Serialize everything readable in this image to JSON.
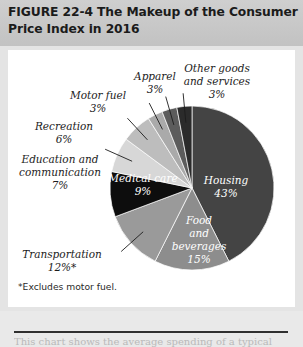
{
  "figure": {
    "number": "FIGURE  22-4",
    "title": "The Makeup of the Consumer Price Index in 2016",
    "title_line1": "FIGURE  22-4   The Makeup of the Consumer",
    "title_line2": "Price Index in 2016",
    "footnote": "*Excludes motor fuel."
  },
  "chart_data": {
    "type": "pie",
    "title": "The Makeup of the Consumer Price Index in 2016",
    "unit": "percent",
    "legend": "none",
    "labels_on_slices": true,
    "categories": [
      "Housing",
      "Food and beverages",
      "Transportation",
      "Medical care",
      "Education and communication",
      "Recreation",
      "Motor fuel",
      "Apparel",
      "Other goods and services"
    ],
    "values": [
      43,
      15,
      12,
      9,
      7,
      6,
      3,
      3,
      3
    ],
    "slices": [
      {
        "name": "Housing",
        "label": "Housing",
        "label_line2": "",
        "value": 43,
        "value_text": "43%",
        "color": "#444444",
        "text_color": "#ffffff",
        "placement": "inside",
        "lx": 226,
        "ly": 184,
        "l2y": 197
      },
      {
        "name": "Food and beverages",
        "label": "Food",
        "label_line2": "and",
        "label_line3": "beverages",
        "value": 15,
        "value_text": "15%",
        "color": "#8d8d8d",
        "text_color": "#ffffff",
        "placement": "inside",
        "lx": 199,
        "ly": 224,
        "l2y": 238
      },
      {
        "name": "Transportation",
        "label": "Transportation",
        "label_line2": "",
        "value": 12,
        "value_text": "12%*",
        "color": "#9a9a9a",
        "text_color": "#1c1c1c",
        "placement": "outside",
        "lx": 62,
        "ly": 258,
        "l2y": 271
      },
      {
        "name": "Medical care",
        "label": "Medical care",
        "label_line2": "",
        "value": 9,
        "value_text": "9%",
        "color": "#0d0d0d",
        "text_color": "#ffffff",
        "placement": "inside",
        "lx": 143,
        "ly": 182,
        "l2y": 195
      },
      {
        "name": "Education and communication",
        "label": "Education and",
        "label_line2": "communication",
        "value": 7,
        "value_text": "7%",
        "color": "#d7d7d7",
        "text_color": "#1c1c1c",
        "placement": "outside",
        "lx": 60,
        "ly": 163,
        "l2y": 176
      },
      {
        "name": "Recreation",
        "label": "Recreation",
        "label_line2": "",
        "value": 6,
        "value_text": "6%",
        "color": "#bdbdbd",
        "text_color": "#1c1c1c",
        "placement": "outside",
        "lx": 64,
        "ly": 130,
        "l2y": 143
      },
      {
        "name": "Motor fuel",
        "label": "Motor fuel",
        "label_line2": "",
        "value": 3,
        "value_text": "3%",
        "color": "#aaaaaa",
        "text_color": "#1c1c1c",
        "placement": "outside",
        "lx": 98,
        "ly": 99,
        "l2y": 112
      },
      {
        "name": "Apparel",
        "label": "Apparel",
        "label_line2": "",
        "value": 3,
        "value_text": "3%",
        "color": "#5c5c5c",
        "text_color": "#1c1c1c",
        "placement": "outside",
        "lx": 155,
        "ly": 80,
        "l2y": 93
      },
      {
        "name": "Other goods and services",
        "label": "Other goods",
        "label_line2": "and services",
        "value": 3,
        "value_text": "3%",
        "color": "#2b2b2b",
        "text_color": "#1c1c1c",
        "placement": "outside",
        "lx": 217,
        "ly": 72,
        "l2y": 84
      }
    ],
    "geometry": {
      "cx": 192,
      "cy": 188,
      "r": 82,
      "start_angle_deg": 0
    }
  },
  "teaser": {
    "text": "This chart shows the average spending of a typical"
  }
}
